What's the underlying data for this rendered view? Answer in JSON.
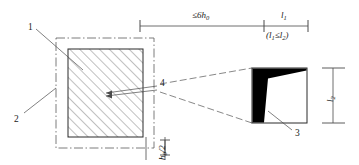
{
  "figure": {
    "type": "engineering-detail-drawing",
    "canvas": {
      "width": 359,
      "height": 165
    },
    "stroke_color": "#3a3a3a",
    "fill_color": "#000000",
    "background": "#ffffff"
  },
  "dimensions": {
    "span_left_label": "≤6h",
    "span_left_sub": "0",
    "span_right_label": "l",
    "span_right_sub": "1",
    "span_right_note_prefix": "(l",
    "span_right_note_sub1": "1",
    "span_right_note_mid": "≤l",
    "span_right_note_sub2": "2",
    "span_right_note_suffix": ")",
    "bottom_label": "h",
    "bottom_sub": "0",
    "bottom_label_suffix": "/2",
    "right_vertical_label": "l",
    "right_vertical_sub": "2"
  },
  "callouts": [
    {
      "id": "1",
      "label": "1",
      "x": 28,
      "y": 23,
      "target": "hatched-core"
    },
    {
      "id": "2",
      "label": "2",
      "x": 14,
      "y": 115,
      "target": "dash-dot-boundary"
    },
    {
      "id": "4",
      "label": "4",
      "x": 160,
      "y": 83,
      "target": "detail-zone"
    },
    {
      "id": "3",
      "label": "3",
      "x": 295,
      "y": 132,
      "target": "wedge-detail"
    }
  ],
  "left_view": {
    "name": "plan-section",
    "outer_boundary_style": "dash-dot",
    "inner_fill_style": "45-degree-hatch"
  },
  "right_view": {
    "name": "enlarged-detail",
    "shape": "square-with-tapered-black-wedge"
  }
}
